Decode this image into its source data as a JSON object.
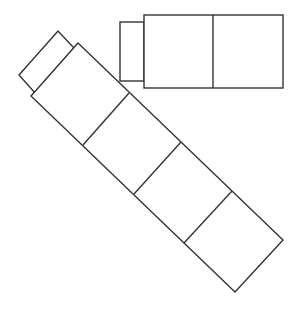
{
  "diagram": {
    "stroke_color": "#333333",
    "fill_color": "#ffffff",
    "background": "#ffffff",
    "horizontal_block": {
      "cells": 2,
      "has_end_tab": true,
      "tab_side": "left"
    },
    "diagonal_block": {
      "cells": 4,
      "has_end_tab": true,
      "tab_side": "top-left",
      "orientation": "rotated approx 45 degrees, running top-left to bottom-right"
    }
  }
}
